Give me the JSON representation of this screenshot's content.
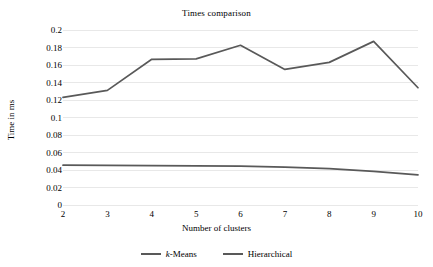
{
  "chart_data": {
    "type": "line",
    "title": "Times comparison",
    "xlabel": "Number of clusters",
    "ylabel": "Time in ms",
    "categories": [
      2,
      3,
      4,
      5,
      6,
      7,
      8,
      9,
      10
    ],
    "x_tick_labels": [
      "2",
      "3",
      "4",
      "5",
      "6",
      "7",
      "8",
      "9",
      "10"
    ],
    "y_tick_labels": [
      "0.2",
      "0.18",
      "0.16",
      "0.14",
      "0.12",
      "0.1",
      "0.08",
      "0.06",
      "0.04",
      "0.02",
      "0"
    ],
    "y_tick_values": [
      0.2,
      0.18,
      0.16,
      0.14,
      0.12,
      0.1,
      0.08,
      0.06,
      0.04,
      0.02,
      0
    ],
    "ylim": [
      0,
      0.2
    ],
    "xlim": [
      2,
      10
    ],
    "grid": "horizontal",
    "legend_position": "bottom",
    "series": [
      {
        "name": "k-Means",
        "name_italic_prefix": "k",
        "name_rest": "-Means",
        "color": "#595959",
        "values": [
          0.123,
          0.131,
          0.1665,
          0.167,
          0.1825,
          0.155,
          0.163,
          0.187,
          0.134
        ]
      },
      {
        "name": "Hierarchical",
        "color": "#595959",
        "values": [
          0.0455,
          0.0452,
          0.045,
          0.0448,
          0.0444,
          0.0432,
          0.0415,
          0.0385,
          0.0345
        ]
      }
    ],
    "colors": {
      "line": "#595959",
      "gridline": "#e8e8e8",
      "text": "#000000",
      "background": "#ffffff"
    }
  }
}
